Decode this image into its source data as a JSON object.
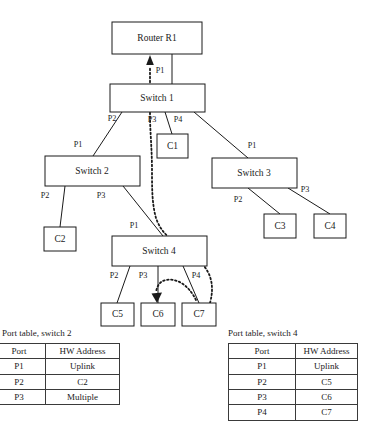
{
  "diagram": {
    "nodes": {
      "router": {
        "label": "Router R1"
      },
      "switch1": {
        "label": "Switch 1"
      },
      "switch2": {
        "label": "Switch 2"
      },
      "switch3": {
        "label": "Switch 3"
      },
      "switch4": {
        "label": "Switch 4"
      },
      "c1": {
        "label": "C1"
      },
      "c2": {
        "label": "C2"
      },
      "c3": {
        "label": "C3"
      },
      "c4": {
        "label": "C4"
      },
      "c5": {
        "label": "C5"
      },
      "c6": {
        "label": "C6"
      },
      "c7": {
        "label": "C7"
      }
    },
    "port_labels": {
      "s1_p1": "P1",
      "s1_p2": "P2",
      "s1_p3": "P3",
      "s1_p4": "P4",
      "s2_p1": "P1",
      "s2_p2": "P2",
      "s2_p3": "P3",
      "s3_p1": "P1",
      "s3_p2": "P2",
      "s3_p3": "P3",
      "s4_p1": "P1",
      "s4_p2": "P2",
      "s4_p3": "P3",
      "s4_p4": "P4"
    },
    "colors": {
      "line": "#1a1a1a",
      "box_fill": "#ffffff",
      "text": "#1a1a1a"
    }
  },
  "tables": [
    {
      "id": "switch2",
      "caption": "Port table, switch 2",
      "columns": [
        "Port",
        "HW Address"
      ],
      "rows": [
        [
          "P1",
          "Uplink"
        ],
        [
          "P2",
          "C2"
        ],
        [
          "P3",
          "Multiple"
        ]
      ]
    },
    {
      "id": "switch4",
      "caption": "Port table, switch 4",
      "columns": [
        "Port",
        "HW  Address"
      ],
      "rows": [
        [
          "P1",
          "Uplink"
        ],
        [
          "P2",
          "C5"
        ],
        [
          "P3",
          "C6"
        ],
        [
          "P4",
          "C7"
        ]
      ]
    }
  ]
}
